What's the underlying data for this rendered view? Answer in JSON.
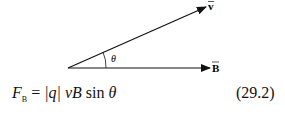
{
  "diagram": {
    "vector_v_label": "v",
    "vector_b_label": "B",
    "angle_label": "θ"
  },
  "equation": {
    "lhs_main": "F",
    "lhs_sub": "B",
    "eq_sign": " = ",
    "abs_q": "|q| ",
    "vB": "vB ",
    "sin": "sin ",
    "theta": "θ",
    "number": "(29.2)"
  }
}
